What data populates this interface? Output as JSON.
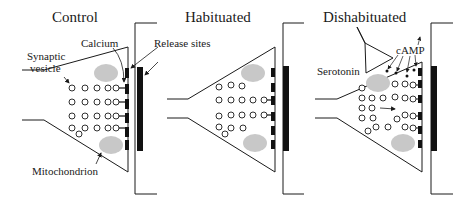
{
  "panels": [
    {
      "id": "control",
      "title": "Control"
    },
    {
      "id": "habituated",
      "title": "Habituated"
    },
    {
      "id": "dishabituated",
      "title": "Dishabituated"
    }
  ],
  "labels": {
    "calcium": "Calcium",
    "release_sites": "Release  sites",
    "synaptic_vesicle_line1": "Synaptic",
    "synaptic_vesicle_line2": "vesicle",
    "mitochondrion": "Mitochondrion",
    "serotonin": "Serotonin",
    "camp": "cAMP"
  },
  "colors": {
    "line": "#1a1a1a",
    "mitochondrion": "#c8c8c8",
    "release_site": "#111111"
  }
}
